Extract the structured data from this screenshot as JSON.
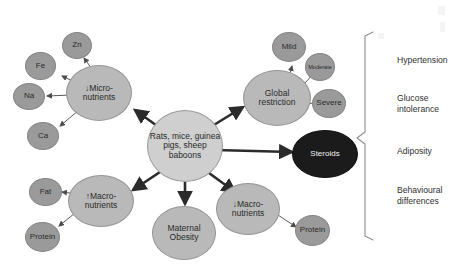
{
  "diagram": {
    "center": {
      "label": "Rats, mice, guinea pigs, sheep baboons",
      "name": "species-node"
    },
    "branches": [
      {
        "id": "micronutrients",
        "label": "↓Micro-nutrients",
        "line1": "↓Micro-",
        "line2": "nutrients"
      },
      {
        "id": "global-restriction",
        "label": "Global restriction",
        "line1": "Global",
        "line2": "restriction"
      },
      {
        "id": "steroids",
        "label": "Steroids"
      },
      {
        "id": "macronutrients-up",
        "label": "↑Macro-nutrients",
        "line1": "↑Macro-",
        "line2": "nutrients"
      },
      {
        "id": "maternal-obesity",
        "label": "Maternal Obesity",
        "line1": "Maternal",
        "line2": "Obesity"
      },
      {
        "id": "macronutrients-down",
        "label": "↓Macro-nutrients",
        "line1": "↓Macro-",
        "line2": "nutrients"
      }
    ],
    "satellites": [
      {
        "id": "zn",
        "label": "Zn",
        "parent": "micronutrients"
      },
      {
        "id": "fe",
        "label": "Fe",
        "parent": "micronutrients"
      },
      {
        "id": "na",
        "label": "Na",
        "parent": "micronutrients"
      },
      {
        "id": "ca",
        "label": "Ca",
        "parent": "micronutrients"
      },
      {
        "id": "mild",
        "label": "Mild",
        "parent": "global-restriction"
      },
      {
        "id": "moderate",
        "label": "Moderate",
        "parent": "global-restriction"
      },
      {
        "id": "severe",
        "label": "Severe",
        "parent": "global-restriction"
      },
      {
        "id": "fat",
        "label": "Fat",
        "parent": "macronutrients-up"
      },
      {
        "id": "protein-left",
        "label": "Protein",
        "parent": "macronutrients-up"
      },
      {
        "id": "protein-right",
        "label": "Protein",
        "parent": "macronutrients-down"
      }
    ],
    "outcomes": [
      {
        "id": "hypertension",
        "line1": "Hypertension",
        "line2": ""
      },
      {
        "id": "glucose-intolerance",
        "line1": "Glucose",
        "line2": "intolerance"
      },
      {
        "id": "adiposity",
        "line1": "Adiposity",
        "line2": ""
      },
      {
        "id": "behavioural-differences",
        "line1": "Behavioural",
        "line2": "differences"
      }
    ],
    "colors": {
      "center_fill": "#cfcfcf",
      "major_fill": "#b9b9b9",
      "minor_fill": "#9a9a9a",
      "dark_fill": "#1b1b1b",
      "line": "#6e6e6e",
      "background": "#ffffff"
    }
  }
}
